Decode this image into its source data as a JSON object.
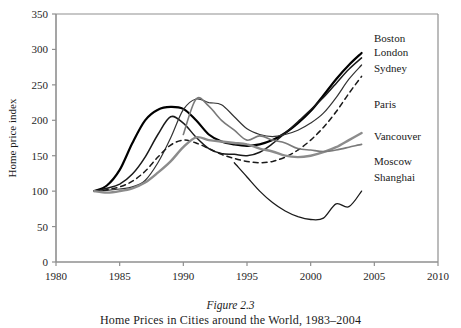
{
  "figure": {
    "caption_title": "Figure 2.3",
    "caption_subtitle": "Home Prices in Cities around the World, 1983–2004"
  },
  "chart_data": {
    "type": "line",
    "title": "",
    "xlabel": "",
    "ylabel": "Home price index",
    "xlim": [
      1980,
      2010
    ],
    "ylim": [
      0,
      350
    ],
    "xticks": [
      1980,
      1985,
      1990,
      1995,
      2000,
      2005,
      2010
    ],
    "yticks": [
      0,
      50,
      100,
      150,
      200,
      250,
      300,
      350
    ],
    "grid": false,
    "legend_position": "right-inline-labels",
    "series": [
      {
        "name": "Boston",
        "color": "#000000",
        "width": 2.2,
        "dash": "none",
        "x": [
          1983,
          1984,
          1985,
          1986,
          1987,
          1988,
          1989,
          1990,
          1991,
          1992,
          1993,
          1994,
          1995,
          1996,
          1997,
          1998,
          1999,
          2000,
          2001,
          2002,
          2003,
          2004
        ],
        "values": [
          100,
          108,
          130,
          168,
          200,
          215,
          219,
          216,
          200,
          180,
          170,
          166,
          164,
          166,
          172,
          182,
          196,
          213,
          235,
          258,
          278,
          295
        ]
      },
      {
        "name": "London",
        "color": "#1a1a1a",
        "width": 1.5,
        "dash": "none",
        "x": [
          1983,
          1984,
          1985,
          1986,
          1987,
          1988,
          1989,
          1990,
          1991,
          1992,
          1993,
          1994,
          1995,
          1996,
          1997,
          1998,
          1999,
          2000,
          2001,
          2002,
          2003,
          2004
        ],
        "values": [
          100,
          104,
          110,
          124,
          148,
          180,
          205,
          196,
          176,
          160,
          153,
          152,
          150,
          155,
          167,
          182,
          198,
          215,
          232,
          252,
          272,
          288
        ]
      },
      {
        "name": "Sydney",
        "color": "#333333",
        "width": 1.2,
        "dash": "none",
        "x": [
          1983,
          1984,
          1985,
          1986,
          1987,
          1988,
          1989,
          1990,
          1991,
          1992,
          1993,
          1994,
          1995,
          1996,
          1997,
          1998,
          1999,
          2000,
          2001,
          2002,
          2003,
          2004
        ],
        "values": [
          100,
          101,
          103,
          106,
          115,
          140,
          175,
          215,
          230,
          225,
          222,
          205,
          188,
          180,
          177,
          180,
          186,
          196,
          210,
          232,
          258,
          278
        ]
      },
      {
        "name": "Paris",
        "color": "#1a1a1a",
        "width": 1.5,
        "dash": "5,4",
        "x": [
          1983,
          1984,
          1985,
          1986,
          1987,
          1988,
          1989,
          1990,
          1991,
          1992,
          1993,
          1994,
          1995,
          1996,
          1997,
          1998,
          1999,
          2000,
          2001,
          2002,
          2003,
          2004
        ],
        "values": [
          100,
          102,
          106,
          114,
          128,
          148,
          165,
          172,
          168,
          160,
          152,
          146,
          142,
          140,
          142,
          148,
          158,
          172,
          190,
          212,
          238,
          262
        ]
      },
      {
        "name": "Vancouver",
        "color": "#8c8c8c",
        "width": 2.4,
        "dash": "none",
        "x": [
          1983,
          1984,
          1985,
          1986,
          1987,
          1988,
          1989,
          1990,
          1991,
          1992,
          1993,
          1994,
          1995,
          1996,
          1997,
          1998,
          1999,
          2000,
          2001,
          2002,
          2003,
          2004
        ],
        "values": [
          100,
          98,
          100,
          104,
          112,
          126,
          142,
          162,
          176,
          172,
          170,
          168,
          166,
          160,
          156,
          150,
          148,
          150,
          155,
          162,
          172,
          182
        ]
      },
      {
        "name": "Moscow",
        "color": "#7a7a7a",
        "width": 1.6,
        "dash": "none",
        "x": [
          1990,
          1991,
          1992,
          1993,
          1994,
          1995,
          1996,
          1997,
          1998,
          1999,
          2000,
          2001,
          2002,
          2003,
          2004
        ],
        "values": [
          180,
          230,
          220,
          200,
          186,
          172,
          178,
          172,
          168,
          160,
          158,
          156,
          158,
          162,
          166
        ]
      },
      {
        "name": "Shanghai",
        "color": "#1a1a1a",
        "width": 1.3,
        "dash": "none",
        "x": [
          1994,
          1995,
          1996,
          1997,
          1998,
          1999,
          2000,
          2001,
          2002,
          2003,
          2004
        ],
        "values": [
          140,
          120,
          100,
          84,
          72,
          64,
          60,
          62,
          82,
          78,
          100
        ]
      }
    ]
  },
  "legend": {
    "items": [
      {
        "label": "Boston"
      },
      {
        "label": "London"
      },
      {
        "label": "Sydney"
      },
      {
        "label": "Paris"
      },
      {
        "label": "Vancouver"
      },
      {
        "label": "Moscow"
      },
      {
        "label": "Shanghai"
      }
    ]
  }
}
